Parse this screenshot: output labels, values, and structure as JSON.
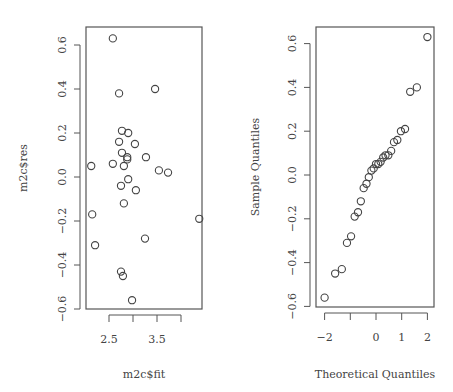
{
  "chart_data": [
    {
      "type": "scatter",
      "title": "",
      "xlabel": "m2c$fit",
      "ylabel": "m2c$res",
      "xlim": [
        2.05,
        4.45
      ],
      "ylim": [
        -0.6,
        0.65
      ],
      "xticks": [
        2.5,
        3.0,
        3.5,
        4.0
      ],
      "xtick_labels": [
        "2.5",
        "",
        "3.5",
        ""
      ],
      "yticks": [
        -0.6,
        -0.4,
        -0.2,
        0.0,
        0.2,
        0.4,
        0.6
      ],
      "ytick_labels": [
        "−0.6",
        "−0.4",
        "−0.2",
        "0.0",
        "0.2",
        "0.4",
        "0.6"
      ],
      "grid": false,
      "marker": "open-circle",
      "points": [
        {
          "x": 2.58,
          "y": 0.63
        },
        {
          "x": 2.71,
          "y": 0.38
        },
        {
          "x": 3.46,
          "y": 0.4
        },
        {
          "x": 2.77,
          "y": 0.21
        },
        {
          "x": 2.9,
          "y": 0.2
        },
        {
          "x": 2.71,
          "y": 0.16
        },
        {
          "x": 3.04,
          "y": 0.15
        },
        {
          "x": 2.77,
          "y": 0.11
        },
        {
          "x": 2.88,
          "y": 0.09
        },
        {
          "x": 2.88,
          "y": 0.08
        },
        {
          "x": 3.27,
          "y": 0.09
        },
        {
          "x": 2.13,
          "y": 0.05
        },
        {
          "x": 2.58,
          "y": 0.06
        },
        {
          "x": 2.81,
          "y": 0.05
        },
        {
          "x": 3.54,
          "y": 0.03
        },
        {
          "x": 3.73,
          "y": 0.02
        },
        {
          "x": 2.9,
          "y": -0.01
        },
        {
          "x": 2.75,
          "y": -0.04
        },
        {
          "x": 3.06,
          "y": -0.06
        },
        {
          "x": 2.81,
          "y": -0.12
        },
        {
          "x": 2.15,
          "y": -0.17
        },
        {
          "x": 4.38,
          "y": -0.19
        },
        {
          "x": 3.25,
          "y": -0.28
        },
        {
          "x": 2.21,
          "y": -0.31
        },
        {
          "x": 2.75,
          "y": -0.43
        },
        {
          "x": 2.79,
          "y": -0.45
        },
        {
          "x": 2.98,
          "y": -0.56
        }
      ]
    },
    {
      "type": "scatter",
      "title": "",
      "xlabel": "Theoretical Quantiles",
      "ylabel": "Sample Quantiles",
      "xlim": [
        -2.3,
        2.3
      ],
      "ylim": [
        -0.6,
        0.65
      ],
      "xticks": [
        -2,
        -1,
        0,
        1,
        2
      ],
      "xtick_labels": [
        "−2",
        "",
        "0",
        "1",
        "2"
      ],
      "yticks": [
        -0.6,
        -0.4,
        -0.2,
        0.0,
        0.2,
        0.4,
        0.6
      ],
      "ytick_labels": [
        "−0.6",
        "−0.4",
        "−0.2",
        "0.0",
        "0.2",
        "0.4",
        "0.6"
      ],
      "grid": false,
      "marker": "open-circle",
      "points": [
        {
          "x": -2.0,
          "y": -0.56
        },
        {
          "x": -1.59,
          "y": -0.45
        },
        {
          "x": -1.33,
          "y": -0.43
        },
        {
          "x": -1.13,
          "y": -0.31
        },
        {
          "x": -0.97,
          "y": -0.28
        },
        {
          "x": -0.83,
          "y": -0.19
        },
        {
          "x": -0.7,
          "y": -0.17
        },
        {
          "x": -0.59,
          "y": -0.12
        },
        {
          "x": -0.48,
          "y": -0.06
        },
        {
          "x": -0.37,
          "y": -0.04
        },
        {
          "x": -0.28,
          "y": -0.01
        },
        {
          "x": -0.18,
          "y": 0.02
        },
        {
          "x": -0.09,
          "y": 0.03
        },
        {
          "x": 0.0,
          "y": 0.05
        },
        {
          "x": 0.09,
          "y": 0.05
        },
        {
          "x": 0.18,
          "y": 0.06
        },
        {
          "x": 0.28,
          "y": 0.08
        },
        {
          "x": 0.37,
          "y": 0.09
        },
        {
          "x": 0.48,
          "y": 0.09
        },
        {
          "x": 0.59,
          "y": 0.11
        },
        {
          "x": 0.7,
          "y": 0.15
        },
        {
          "x": 0.83,
          "y": 0.16
        },
        {
          "x": 0.97,
          "y": 0.2
        },
        {
          "x": 1.13,
          "y": 0.21
        },
        {
          "x": 1.33,
          "y": 0.38
        },
        {
          "x": 1.59,
          "y": 0.4
        },
        {
          "x": 2.0,
          "y": 0.63
        }
      ]
    }
  ],
  "layout": {
    "panels": [
      {
        "box": [
          86,
          27,
          202,
          309
        ],
        "x_px": [
          109,
          48
        ],
        "y_px": [
          177,
          220
        ]
      },
      {
        "box": [
          316,
          27,
          434,
          307
        ],
        "x_px": [
          376,
          25.7
        ],
        "y_px": [
          175,
          219
        ]
      }
    ],
    "colors": {
      "axis": "#555555",
      "point": "#444444",
      "text": "#444444"
    }
  }
}
